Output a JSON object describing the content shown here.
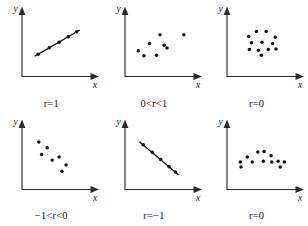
{
  "figure": {
    "axis_label_x": "x",
    "axis_label_y": "y",
    "dot_color": "#121212",
    "axis_color": "#2b2b2b",
    "background": "#ffffff"
  },
  "chart_data": [
    {
      "type": "scatter",
      "title": "r=1",
      "xlabel": "x",
      "ylabel": "y",
      "xlim": [
        0,
        10
      ],
      "ylim": [
        0,
        10
      ],
      "grid": false,
      "legend": false,
      "annotation": "Perfect positive linear relationship; points lie exactly on an upward line",
      "trend": {
        "x1": 1.9,
        "y1": 3.3,
        "x2": 8.2,
        "y2": 7.4
      },
      "x": [
        2.3,
        3.9,
        5.3,
        6.6,
        7.8
      ],
      "y": [
        3.55,
        4.6,
        5.5,
        6.35,
        7.15
      ]
    },
    {
      "type": "scatter",
      "title": "0<r<1",
      "xlabel": "x",
      "ylabel": "y",
      "xlim": [
        0,
        10
      ],
      "ylim": [
        0,
        10
      ],
      "grid": false,
      "legend": false,
      "annotation": "Moderate positive association; scattered cloud trending upward",
      "trend": null,
      "x": [
        1.9,
        2.7,
        3.5,
        4.5,
        5.0,
        5.6,
        6.0,
        8.4
      ],
      "y": [
        4.1,
        3.3,
        5.3,
        3.4,
        6.7,
        5.0,
        4.55,
        6.7
      ]
    },
    {
      "type": "scatter",
      "title": "r=0",
      "xlabel": "x",
      "ylabel": "y",
      "xlim": [
        0,
        10
      ],
      "ylim": [
        0,
        10
      ],
      "grid": false,
      "legend": false,
      "annotation": "No linear association; points arranged in a circular cluster",
      "trend": null,
      "x": [
        3.1,
        4.2,
        5.6,
        6.9,
        3.5,
        5.0,
        6.5,
        3.2,
        4.5,
        5.9,
        7.0,
        4.9
      ],
      "y": [
        6.4,
        7.2,
        7.2,
        6.3,
        5.4,
        5.5,
        5.3,
        4.3,
        4.2,
        4.3,
        4.4,
        3.4
      ]
    },
    {
      "type": "scatter",
      "title": "−1<r<0",
      "xlabel": "x",
      "ylabel": "y",
      "xlim": [
        0,
        10
      ],
      "ylim": [
        0,
        10
      ],
      "grid": false,
      "legend": false,
      "annotation": "Moderate negative association; scattered cloud trending downward",
      "trend": null,
      "x": [
        2.4,
        3.6,
        2.8,
        4.3,
        5.3,
        6.3,
        5.7
      ],
      "y": [
        7.6,
        6.7,
        5.6,
        4.7,
        5.2,
        3.9,
        2.9
      ]
    },
    {
      "type": "scatter",
      "title": "r=−1",
      "xlabel": "x",
      "ylabel": "y",
      "xlim": [
        0,
        10
      ],
      "ylim": [
        0,
        10
      ],
      "grid": false,
      "legend": false,
      "annotation": "Perfect negative linear relationship; points lie exactly on a downward line",
      "trend": {
        "x1": 2.1,
        "y1": 7.6,
        "x2": 7.6,
        "y2": 2.4
      },
      "x": [
        2.6,
        3.9,
        5.1,
        6.3,
        7.2
      ],
      "y": [
        7.15,
        5.95,
        4.8,
        3.65,
        2.8
      ]
    },
    {
      "type": "scatter",
      "title": "r=0",
      "xlabel": "x",
      "ylabel": "y",
      "xlim": [
        0,
        10
      ],
      "ylim": [
        0,
        10
      ],
      "grid": false,
      "legend": false,
      "annotation": "No linear association; points form an arch (nonlinear) pattern",
      "trend": null,
      "x": [
        1.9,
        2.0,
        2.9,
        3.6,
        4.4,
        5.3,
        5.2,
        6.3,
        6.4,
        7.3,
        7.6,
        8.2
      ],
      "y": [
        4.4,
        3.6,
        5.2,
        4.4,
        6.0,
        6.1,
        4.5,
        5.4,
        4.4,
        4.5,
        3.6,
        4.4
      ]
    }
  ]
}
